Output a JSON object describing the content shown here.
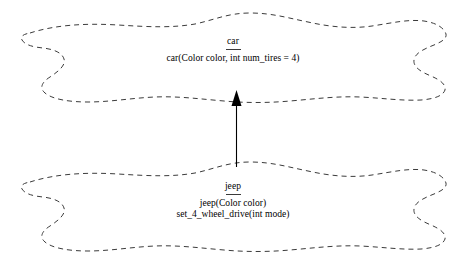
{
  "diagram": {
    "type": "uml-inheritance",
    "background_color": "#ffffff",
    "outline_color": "#3b3b3b",
    "text_color": "#000000",
    "classes": [
      {
        "id": "car",
        "name": "car",
        "members": [
          "car(Color color, int num_tires = 4)"
        ]
      },
      {
        "id": "jeep",
        "name": "jeep",
        "members": [
          "jeep(Color color)",
          "set_4_wheel_drive(int mode)"
        ]
      }
    ],
    "relationship": {
      "name": "inheritance-arrow",
      "from": "jeep",
      "to": "car",
      "style": "solid-line-filled-triangle"
    }
  }
}
